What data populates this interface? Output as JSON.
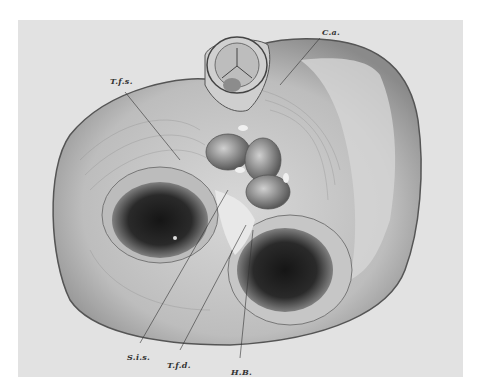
{
  "figure": {
    "labels": [
      {
        "id": "ca",
        "text": "C.a.",
        "x": 322,
        "y": 27
      },
      {
        "id": "tfs",
        "text": "T.f.s.",
        "x": 110,
        "y": 76
      },
      {
        "id": "sis",
        "text": "S.i.s.",
        "x": 127,
        "y": 352
      },
      {
        "id": "tfd",
        "text": "T.f.d.",
        "x": 167,
        "y": 360
      },
      {
        "id": "hb",
        "text": "H.B.",
        "x": 231,
        "y": 367
      }
    ]
  }
}
